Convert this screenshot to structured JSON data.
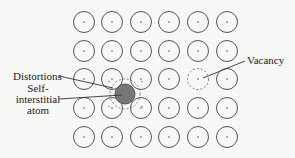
{
  "diagram": {
    "lattice": {
      "rows": 5,
      "cols": 6,
      "x_centers": [
        84,
        112,
        141,
        169,
        198,
        227
      ],
      "y_centers": [
        22,
        51,
        79,
        108,
        137
      ],
      "atom_radius": 10.5,
      "atom_stroke": "#555555",
      "dot_color": "#555555"
    },
    "vacancy": {
      "row": 2,
      "col": 4,
      "stroke": "#777777",
      "dash": "2,2"
    },
    "interstitial": {
      "cx": 125,
      "cy": 94,
      "r": 10,
      "fill": "#777777",
      "stroke": "#555555",
      "distortion_r": 15
    },
    "labels": {
      "distortions": "Distortions",
      "self_interstitial_line1": "Self-",
      "self_interstitial_line2": "interstitial",
      "self_interstitial_line3": "atom",
      "vacancy": "Vacancy"
    },
    "leaders": {
      "distortions": {
        "x1": 59,
        "y1": 76,
        "x2": 113,
        "y2": 88
      },
      "interstitial": {
        "x1": 59,
        "y1": 99,
        "x2": 122,
        "y2": 95
      },
      "vacancy": {
        "x1": 245,
        "y1": 61,
        "x2": 203,
        "y2": 78
      }
    }
  }
}
